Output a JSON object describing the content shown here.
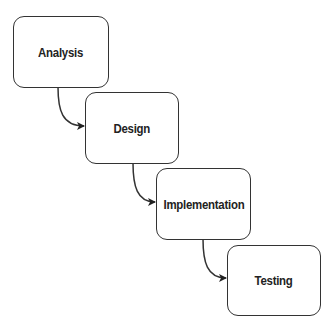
{
  "diagram": {
    "type": "waterfall",
    "stages": [
      {
        "label": "Analysis"
      },
      {
        "label": "Design"
      },
      {
        "label": "Implementation"
      },
      {
        "label": "Testing"
      }
    ],
    "edges": [
      {
        "from": "Analysis",
        "to": "Design"
      },
      {
        "from": "Design",
        "to": "Implementation"
      },
      {
        "from": "Implementation",
        "to": "Testing"
      }
    ]
  }
}
